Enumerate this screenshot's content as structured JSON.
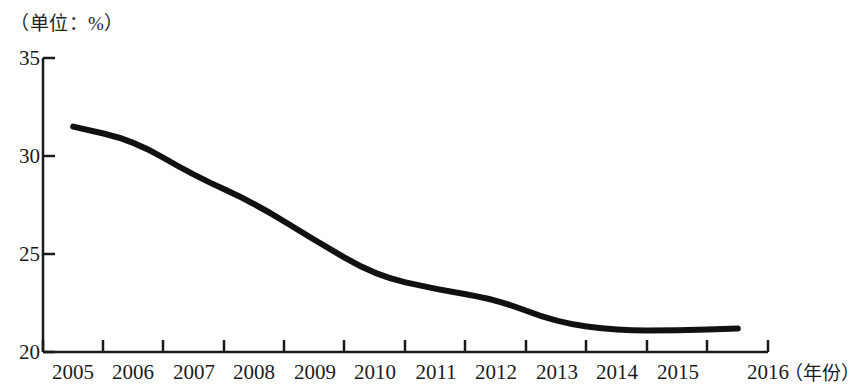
{
  "chart_data": {
    "type": "line",
    "title": "（单位：%）",
    "xlabel": "（年份）",
    "ylabel": "",
    "categories": [
      "2005",
      "2006",
      "2007",
      "2008",
      "2009",
      "2010",
      "2011",
      "2012",
      "2013",
      "2014",
      "2015",
      "2016"
    ],
    "values": [
      31.5,
      30.8,
      29.0,
      27.6,
      25.7,
      23.9,
      23.2,
      22.7,
      21.5,
      21.1,
      21.1,
      21.2
    ],
    "series": [
      {
        "name": "比重",
        "values": [
          31.5,
          30.8,
          29.0,
          27.6,
          25.7,
          23.9,
          23.2,
          22.7,
          21.5,
          21.1,
          21.1,
          21.2
        ]
      }
    ],
    "ylim": [
      20,
      35
    ],
    "yticks": [
      "35",
      "30",
      "25",
      "20"
    ],
    "ytick_values": [
      35,
      30,
      25,
      20
    ],
    "xlim": [
      "2005",
      "2016"
    ],
    "grid": false,
    "legend": false,
    "line_color": "#111111",
    "axis_color": "#1a1a1a",
    "background_color": "#ffffff"
  },
  "axis": {
    "unit_note": "（单位：%）",
    "x_axis_title": "（年份）"
  }
}
